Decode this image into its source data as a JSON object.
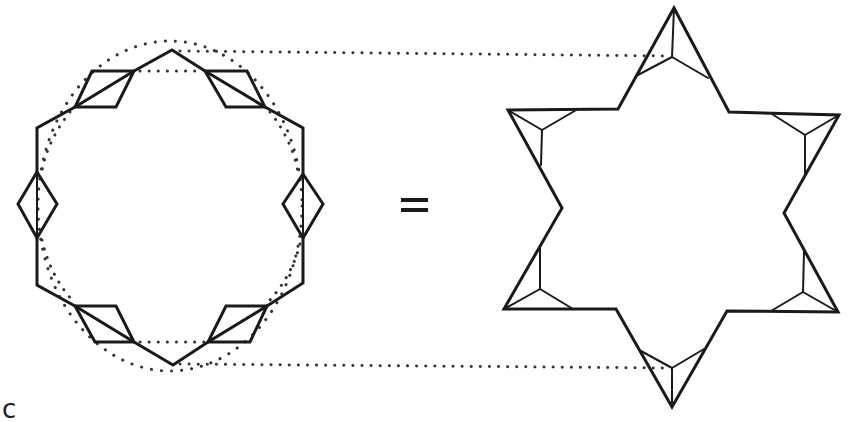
{
  "figure": {
    "operator": "=",
    "panel_label": "c",
    "left_shape": {
      "name": "octagonal ring with rhombus units",
      "unit_count": 6,
      "unit_shape": "rhombus",
      "has_dotted_inner_circle": true
    },
    "right_shape": {
      "name": "hexagram (six-pointed star) with triangular units",
      "unit_count": 6,
      "unit_shape": "triangle with three internal spokes"
    },
    "connectors": {
      "style": "dotted",
      "count": 2,
      "meaning": "top and bottom vertices of left shape map to top and bottom tips of the star"
    },
    "colors": {
      "line": "#1a1a1a",
      "background": "#ffffff"
    }
  }
}
